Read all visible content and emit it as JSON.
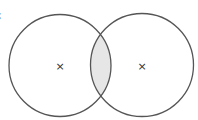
{
  "figure": {
    "label_fragment": "c",
    "circles": [
      {
        "name": "left",
        "cx": 60,
        "cy": 65.5,
        "r": 51
      },
      {
        "name": "right",
        "cx": 142,
        "cy": 65,
        "r": 51.5
      }
    ],
    "centers_marker": "×",
    "intersection_fill": "#e6e6e6",
    "stroke_color": "#555555",
    "marker_color": "#333333"
  }
}
